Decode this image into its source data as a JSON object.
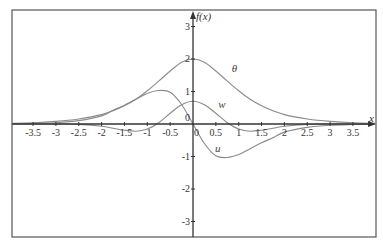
{
  "chart_data": {
    "type": "line",
    "title": "",
    "xlabel": "x",
    "ylabel": "f(x)",
    "xlim": [
      -3.9,
      3.9
    ],
    "ylim": [
      -3.6,
      3.6
    ],
    "grid": false,
    "legend": "inline labels",
    "x_ticks": [
      -3.5,
      -3,
      -2.5,
      -2,
      -1.5,
      -1,
      -0.5,
      0,
      0.5,
      1,
      1.5,
      2,
      2.5,
      3,
      3.5
    ],
    "x_tick_labels": [
      "-3.5",
      "-3",
      "-2.5",
      "-2",
      "-1.5",
      "-1",
      "-0.5",
      "0",
      "0.5",
      "1",
      "1.5",
      "2",
      "2.5",
      "3",
      "3.5"
    ],
    "y_ticks": [
      -3,
      -2,
      -1,
      0,
      1,
      2,
      3
    ],
    "y_tick_labels": [
      "-3",
      "-2",
      "-1",
      "0",
      "1",
      "2",
      "3"
    ],
    "x": [
      -4,
      -3.5,
      -3,
      -2.5,
      -2,
      -1.75,
      -1.5,
      -1.25,
      -1,
      -0.75,
      -0.5,
      -0.25,
      0,
      0.25,
      0.5,
      0.75,
      1,
      1.25,
      1.5,
      1.75,
      2,
      2.5,
      3,
      3.5,
      4
    ],
    "series": [
      {
        "name": "θ",
        "label_pos": [
          0.85,
          1.6
        ],
        "values": [
          0.02,
          0.04,
          0.08,
          0.155,
          0.29,
          0.41,
          0.56,
          0.76,
          1.02,
          1.32,
          1.63,
          1.9,
          2.0,
          1.9,
          1.63,
          1.32,
          1.02,
          0.76,
          0.56,
          0.41,
          0.29,
          0.155,
          0.08,
          0.04,
          0.02
        ]
      },
      {
        "name": "w",
        "label_pos": [
          0.55,
          0.5
        ],
        "values": [
          0.0,
          0.0,
          0.0,
          -0.012,
          -0.07,
          -0.13,
          -0.19,
          -0.22,
          -0.155,
          0.04,
          0.33,
          0.59,
          0.7,
          0.59,
          0.33,
          0.04,
          -0.155,
          -0.22,
          -0.19,
          -0.13,
          -0.07,
          -0.012,
          0.0,
          0.0,
          0.0
        ]
      },
      {
        "name": "u",
        "label_pos": [
          0.48,
          -0.85
        ],
        "values": [
          0.005,
          0.015,
          0.04,
          0.105,
          0.25,
          0.42,
          0.58,
          0.76,
          0.94,
          1.03,
          0.98,
          0.6,
          0.0,
          -0.6,
          -0.98,
          -1.03,
          -0.94,
          -0.76,
          -0.58,
          -0.42,
          -0.25,
          -0.105,
          -0.04,
          -0.015,
          -0.005
        ]
      }
    ]
  },
  "colors": {
    "frame": "#555555",
    "axes": "#333333",
    "curves": "#8a8a8a",
    "background": "#ffffff"
  }
}
